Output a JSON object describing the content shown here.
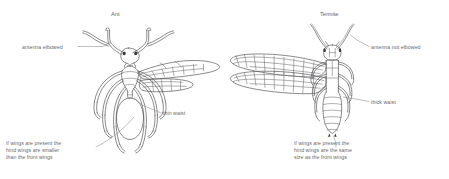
{
  "figure": {
    "background_color": "#ffffff",
    "ink_color": "#58585a",
    "text_color": "#6a6a6d",
    "leader_color": "#8a8a8d"
  },
  "panels": {
    "ant": {
      "title": "Ant",
      "labels": {
        "antenna": "antenna elbowed",
        "waist": "thin waist",
        "wings": "if wings are present the\nhind wings are smaller\nthan the front wings"
      }
    },
    "termite": {
      "title": "Termite",
      "labels": {
        "antenna": "antenna not elbowed",
        "waist": "thick waist",
        "wings": "if wings are present the\nhind wings are the same\nsize as the front wings"
      }
    }
  }
}
